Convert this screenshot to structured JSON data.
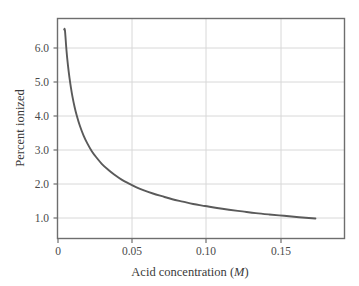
{
  "figure": {
    "background_color": "#ffffff",
    "frame_color": "#6e6e6e",
    "grid_color": "#d8d8d8",
    "curve_color": "#5a5a5a",
    "text_color": "#3c3c3c"
  },
  "chart_data": {
    "type": "line",
    "title": "",
    "subtitle": "",
    "xlabel_text": "Acid concentration",
    "xlabel_unit": "(M)",
    "xlabel": "Acid concentration (M)",
    "ylabel": "Percent ionized",
    "xlim": [
      0,
      0.1925
    ],
    "ylim": [
      0.55,
      7.05
    ],
    "xticks": [
      0,
      0.05,
      0.1,
      0.15
    ],
    "xtick_labels": [
      "0",
      "0.05",
      "0.10",
      "0.15"
    ],
    "yticks": [
      1,
      2,
      3,
      4,
      5,
      6
    ],
    "ytick_labels": [
      "1.0",
      "2.0",
      "3.0",
      "4.0",
      "5.0",
      "6.0"
    ],
    "grid": true,
    "grid_axis": "both",
    "legend": false,
    "legend_position": "none",
    "series": [
      {
        "name": "Percent ionized vs acid concentration",
        "x": [
          0.0045,
          0.005,
          0.006,
          0.007,
          0.008,
          0.009,
          0.01,
          0.0115,
          0.013,
          0.015,
          0.0175,
          0.02,
          0.023,
          0.026,
          0.03,
          0.034,
          0.038,
          0.043,
          0.048,
          0.053,
          0.058,
          0.064,
          0.07,
          0.077,
          0.084,
          0.091,
          0.099,
          0.107,
          0.115,
          0.124,
          0.133,
          0.142,
          0.152,
          0.162,
          0.173
        ],
        "y": [
          6.72,
          6.7,
          6.12,
          5.67,
          5.31,
          5.01,
          4.75,
          4.43,
          4.17,
          3.88,
          3.59,
          3.36,
          3.13,
          2.95,
          2.74,
          2.58,
          2.44,
          2.29,
          2.17,
          2.06,
          1.97,
          1.88,
          1.8,
          1.71,
          1.64,
          1.57,
          1.51,
          1.45,
          1.4,
          1.35,
          1.3,
          1.26,
          1.22,
          1.18,
          1.14
        ]
      }
    ],
    "annotations": []
  },
  "axes": {
    "y_title": "Percent ionized",
    "x_title_main": "Acid concentration",
    "x_title_unit_open": "(",
    "x_title_unit_symbol": "M",
    "x_title_unit_close": ")"
  }
}
